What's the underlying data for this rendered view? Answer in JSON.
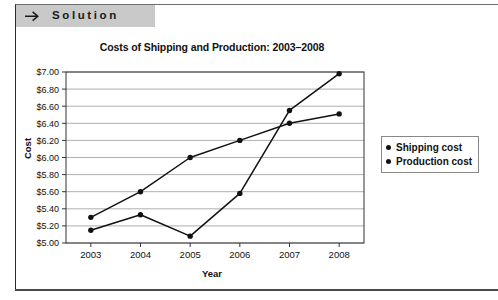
{
  "banner": {
    "label": "Solution",
    "arrow_icon": "right-arrow-icon",
    "background": "#c9c9c9"
  },
  "chart_data": {
    "type": "line",
    "title": "Costs of Shipping and Production: 2003–2008",
    "xlabel": "Year",
    "ylabel": "Cost",
    "categories": [
      "2003",
      "2004",
      "2005",
      "2006",
      "2007",
      "2008"
    ],
    "series": [
      {
        "name": "Shipping cost",
        "values": [
          5.3,
          5.6,
          6.0,
          6.2,
          6.4,
          6.51
        ],
        "color": "#111111",
        "marker": "circle"
      },
      {
        "name": "Production cost",
        "values": [
          5.15,
          5.33,
          5.08,
          5.58,
          6.55,
          6.98
        ],
        "color": "#111111",
        "marker": "circle"
      }
    ],
    "ylim": [
      5.0,
      7.0
    ],
    "ytick_step": 0.2,
    "ytick_labels": [
      "$7.00",
      "$6.80",
      "$6.60",
      "$6.40",
      "$6.20",
      "$6.00",
      "$5.80",
      "$5.60",
      "$5.40",
      "$5.20",
      "$5.00"
    ],
    "grid": true,
    "grid_color": "#9a9a9a",
    "legend_position": "right",
    "legend_entries": [
      "Shipping cost",
      "Production cost"
    ]
  }
}
